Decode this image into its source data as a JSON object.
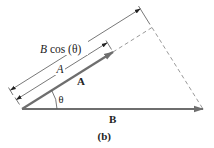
{
  "figure": {
    "caption": "(b)",
    "labels": {
      "projection_dimension": "B cos (θ)",
      "a_magnitude_dimension": "A",
      "vector_a": "A",
      "vector_b": "B",
      "angle": "θ"
    },
    "colors": {
      "vector": "#6e6e6e",
      "dimension_line": "#555555",
      "dashed_line": "#9a9a9a",
      "text": "#222222",
      "background": "#ffffff"
    }
  }
}
